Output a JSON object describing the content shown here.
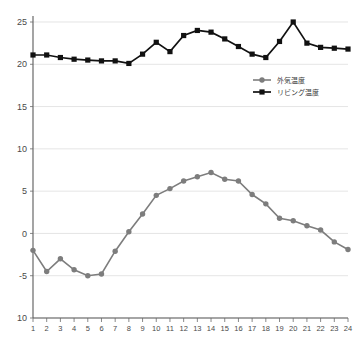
{
  "chart_data": {
    "type": "line",
    "title": "",
    "subtitle": "",
    "xlabel": "",
    "ylabel": "",
    "xlim": [
      1,
      24
    ],
    "ylim": [
      -10,
      25
    ],
    "yticks": [
      25,
      20,
      15,
      10,
      5,
      0,
      -5,
      -10
    ],
    "ytick_labels": [
      "25",
      "20",
      "15",
      "10",
      "5",
      "0",
      "-5",
      "10"
    ],
    "grid": true,
    "legend_position": "upper-right",
    "categories": [
      1,
      2,
      3,
      4,
      5,
      6,
      7,
      8,
      9,
      10,
      11,
      12,
      13,
      14,
      15,
      16,
      17,
      18,
      19,
      20,
      21,
      22,
      23,
      24
    ],
    "xtick_labels": [
      "1",
      "2",
      "3",
      "4",
      "5",
      "6",
      "7",
      "8",
      "9",
      "10",
      "11",
      "12",
      "13",
      "14",
      "15",
      "16",
      "17",
      "18",
      "19",
      "20",
      "21",
      "22",
      "23",
      "24"
    ],
    "series": [
      {
        "name": "外気温度",
        "color": "#7d7d7d",
        "marker": "circle",
        "values": [
          -2.0,
          -4.5,
          -3.0,
          -4.3,
          -5.0,
          -4.8,
          -2.1,
          0.2,
          2.3,
          4.5,
          5.3,
          6.2,
          6.7,
          7.2,
          6.4,
          6.2,
          4.6,
          3.5,
          1.8,
          1.5,
          0.9,
          0.4,
          -1.0,
          -1.9
        ]
      },
      {
        "name": "リビング温度",
        "color": "#111111",
        "marker": "square",
        "values": [
          21.1,
          21.1,
          20.8,
          20.6,
          20.5,
          20.4,
          20.4,
          20.1,
          21.2,
          22.6,
          21.5,
          23.4,
          24.0,
          23.8,
          23.0,
          22.1,
          21.2,
          20.8,
          22.7,
          25.0,
          22.5,
          22.0,
          21.9,
          21.8
        ]
      }
    ],
    "legend": [
      {
        "label": "外気温度",
        "color": "#7d7d7d",
        "marker": "circle"
      },
      {
        "label": "リビング温度",
        "color": "#111111",
        "marker": "square"
      }
    ]
  }
}
